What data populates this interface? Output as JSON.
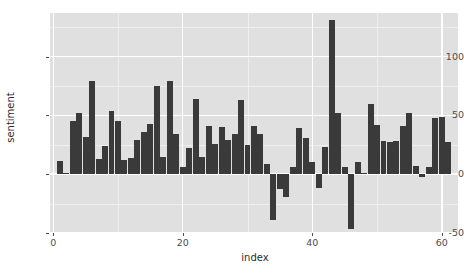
{
  "chart_data": {
    "type": "bar",
    "title": "",
    "subtitle": "",
    "xlabel": "index",
    "ylabel": "sentiment",
    "xlim": [
      -0.5,
      62.5
    ],
    "ylim": [
      -50,
      137
    ],
    "grid": true,
    "legend": null,
    "bar_color": "#3a3a3a",
    "panel_color": "#e0e0e0",
    "gridline_color": "#ffffff",
    "x_ticks": [
      0,
      20,
      40,
      60
    ],
    "y_ticks": [
      -50,
      0,
      50,
      100
    ],
    "x_minor_ticks": [
      10,
      30,
      50
    ],
    "y_minor_ticks": [
      -25,
      25,
      75,
      125
    ],
    "categories": [
      1,
      2,
      3,
      4,
      5,
      6,
      7,
      8,
      9,
      10,
      11,
      12,
      13,
      14,
      15,
      16,
      17,
      18,
      19,
      20,
      21,
      22,
      23,
      24,
      25,
      26,
      27,
      28,
      29,
      30,
      31,
      32,
      33,
      34,
      35,
      36,
      37,
      38,
      39,
      40,
      41,
      42,
      43,
      44,
      45,
      46,
      47,
      48,
      49,
      50,
      51,
      52,
      53,
      54,
      55,
      56,
      57,
      58,
      59,
      60,
      61
    ],
    "values": [
      11,
      1,
      45,
      52,
      32,
      79,
      13,
      24,
      54,
      45,
      12,
      14,
      29,
      36,
      43,
      75,
      15,
      79,
      34,
      6,
      22,
      64,
      15,
      41,
      26,
      40,
      29,
      34,
      63,
      25,
      41,
      34,
      9,
      -39,
      -13,
      -19,
      6,
      39,
      31,
      10,
      -12,
      23,
      131,
      52,
      6,
      -47,
      10,
      1,
      60,
      42,
      28,
      27,
      28,
      41,
      52,
      7,
      -2,
      6,
      48,
      49,
      27
    ]
  },
  "axis": {
    "y_title": "sentiment",
    "x_title": "index",
    "y_tick_labels": [
      "-50",
      "0",
      "50",
      "100"
    ],
    "x_tick_labels": [
      "0",
      "20",
      "40",
      "60"
    ]
  }
}
